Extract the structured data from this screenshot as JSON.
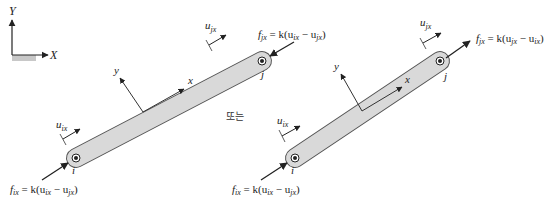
{
  "global_axes": {
    "y_label": "Y",
    "x_label": "X"
  },
  "connector": "또는",
  "colors": {
    "bar_fill": "#d9d9d9",
    "bar_stroke": "#555555",
    "ink": "#222222"
  },
  "left_diagram": {
    "node_i": "i",
    "node_j": "j",
    "local_x": "x",
    "local_y": "y",
    "u_i": "u",
    "u_i_sub": "ix",
    "u_j": "u",
    "u_j_sub": "jx",
    "f_i_eq": "f",
    "f_i_sub": "ix",
    "f_i_rhs": " = k(u",
    "f_i_rhs_sub1": "ix",
    "f_i_mid": " − u",
    "f_i_rhs_sub2": "jx",
    "f_i_close": ")",
    "f_j_eq": "f",
    "f_j_sub": "jx",
    "f_j_rhs": " = k(u",
    "f_j_rhs_sub1": "ix",
    "f_j_mid": " − u",
    "f_j_rhs_sub2": "jx",
    "f_j_close": ")"
  },
  "right_diagram": {
    "node_i": "i",
    "node_j": "j",
    "local_x": "x",
    "local_y": "y",
    "u_i": "u",
    "u_i_sub": "ix",
    "u_j": "u",
    "u_j_sub": "jx",
    "f_i_eq": "f",
    "f_i_sub": "ix",
    "f_i_rhs": " = k(u",
    "f_i_rhs_sub1": "ix",
    "f_i_mid": " − u",
    "f_i_rhs_sub2": "jx",
    "f_i_close": ")",
    "f_j_eq": "f",
    "f_j_sub": "jx",
    "f_j_rhs": " = k(u",
    "f_j_rhs_sub1": "jx",
    "f_j_mid": " − u",
    "f_j_rhs_sub2": "ix",
    "f_j_close": ")"
  }
}
